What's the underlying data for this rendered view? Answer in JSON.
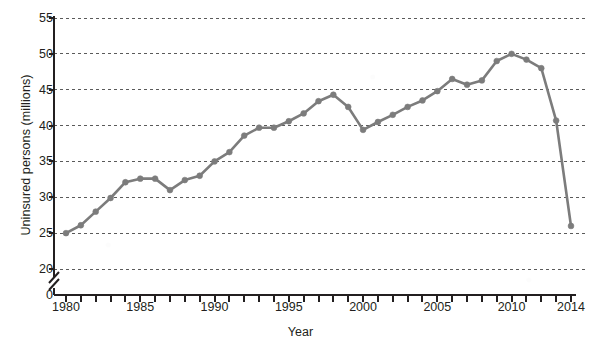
{
  "chart_data": {
    "type": "line",
    "title": "",
    "xlabel": "Year",
    "ylabel": "Uninsured persons (millions)",
    "xlim": [
      1980,
      2014
    ],
    "ylim": [
      20,
      55
    ],
    "y_axis_break": true,
    "y_axis_break_label": "0",
    "grid": true,
    "grid_style": "dotted-horizontal",
    "legend": "none",
    "series_color": "#7c7c7c",
    "marker": "circle",
    "y_ticks": [
      0,
      20,
      25,
      30,
      35,
      40,
      45,
      50,
      55
    ],
    "y_tick_labels": [
      "0",
      "20",
      "25",
      "30",
      "35",
      "40",
      "45",
      "50",
      "55"
    ],
    "x_ticks": [
      1980,
      1981,
      1982,
      1983,
      1984,
      1985,
      1986,
      1987,
      1988,
      1989,
      1990,
      1991,
      1992,
      1993,
      1994,
      1995,
      1996,
      1997,
      1998,
      1999,
      2000,
      2001,
      2002,
      2003,
      2004,
      2005,
      2006,
      2007,
      2008,
      2009,
      2010,
      2011,
      2012,
      2013,
      2014
    ],
    "x_tick_labels": [
      {
        "value": 1980,
        "label": "1980"
      },
      {
        "value": 1985,
        "label": "1985"
      },
      {
        "value": 1990,
        "label": "1990"
      },
      {
        "value": 1995,
        "label": "1995"
      },
      {
        "value": 2000,
        "label": "2000"
      },
      {
        "value": 2005,
        "label": "2005"
      },
      {
        "value": 2010,
        "label": "2010"
      },
      {
        "value": 2014,
        "label": "2014"
      }
    ],
    "x": [
      1980,
      1981,
      1982,
      1983,
      1984,
      1985,
      1986,
      1987,
      1988,
      1989,
      1990,
      1991,
      1992,
      1993,
      1994,
      1995,
      1996,
      1997,
      1998,
      1999,
      2000,
      2001,
      2002,
      2003,
      2004,
      2005,
      2006,
      2007,
      2008,
      2009,
      2010,
      2011,
      2012,
      2013,
      2014
    ],
    "values": [
      25.0,
      26.1,
      28.0,
      29.9,
      32.1,
      32.6,
      32.6,
      31.0,
      32.4,
      33.0,
      35.0,
      36.3,
      38.6,
      39.7,
      39.7,
      40.6,
      41.7,
      43.4,
      44.3,
      42.6,
      39.4,
      40.5,
      41.5,
      42.6,
      43.5,
      44.8,
      46.5,
      45.7,
      46.3,
      49.0,
      50.0,
      49.2,
      48.0,
      40.7,
      26.0
    ]
  }
}
